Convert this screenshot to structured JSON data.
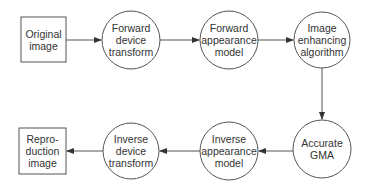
{
  "diagram": {
    "type": "flowchart",
    "stroke_color": "#555555",
    "text_color": "#333333",
    "nodes": [
      {
        "id": "original",
        "shape": "box",
        "label": "Original\nimage"
      },
      {
        "id": "fwd_device",
        "shape": "circle",
        "label": "Forward\ndevice\ntransform"
      },
      {
        "id": "fwd_appearance",
        "shape": "circle",
        "label": "Forward\nappearance\nmodel"
      },
      {
        "id": "enhance",
        "shape": "circle",
        "label": "Image\nenhancing\nalgorithm"
      },
      {
        "id": "gma",
        "shape": "circle",
        "label": "Accurate\nGMA"
      },
      {
        "id": "inv_appearance",
        "shape": "circle",
        "label": "Inverse\nappearance\nmodel"
      },
      {
        "id": "inv_device",
        "shape": "circle",
        "label": "Inverse\ndevice\ntransform"
      },
      {
        "id": "reproduction",
        "shape": "box",
        "label": "Repro-\nduction\nimage"
      }
    ],
    "edges": [
      {
        "from": "original",
        "to": "fwd_device"
      },
      {
        "from": "fwd_device",
        "to": "fwd_appearance"
      },
      {
        "from": "fwd_appearance",
        "to": "enhance"
      },
      {
        "from": "enhance",
        "to": "gma"
      },
      {
        "from": "gma",
        "to": "inv_appearance"
      },
      {
        "from": "inv_appearance",
        "to": "inv_device"
      },
      {
        "from": "inv_device",
        "to": "reproduction"
      }
    ]
  }
}
